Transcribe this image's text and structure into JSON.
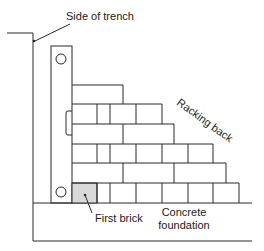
{
  "diagram": {
    "labels": {
      "side_of_trench": "Side of trench",
      "racking_back": "Racking back",
      "first_brick": "First brick",
      "concrete_line1": "Concrete",
      "concrete_line2": "foundation"
    },
    "colors": {
      "line": "#2a2a2a",
      "first_brick_fill": "#d9d9d9",
      "background": "#ffffff"
    },
    "courses": [
      {
        "course": 1,
        "top": 183,
        "bottom": 203,
        "joints": [
          72,
          97,
          110,
          136,
          162,
          188,
          213,
          239
        ]
      },
      {
        "course": 2,
        "top": 163,
        "bottom": 183,
        "joints": [
          72,
          123,
          174,
          226
        ]
      },
      {
        "course": 3,
        "top": 144,
        "bottom": 163,
        "joints": [
          72,
          97,
          110,
          136,
          162,
          188,
          213
        ]
      },
      {
        "course": 4,
        "top": 124,
        "bottom": 144,
        "joints": [
          72,
          123,
          174
        ]
      },
      {
        "course": 5,
        "top": 104,
        "bottom": 124,
        "joints": [
          72,
          97,
          110,
          136,
          162
        ]
      },
      {
        "course": 6,
        "top": 85,
        "bottom": 104,
        "joints": [
          72,
          123
        ]
      }
    ]
  }
}
